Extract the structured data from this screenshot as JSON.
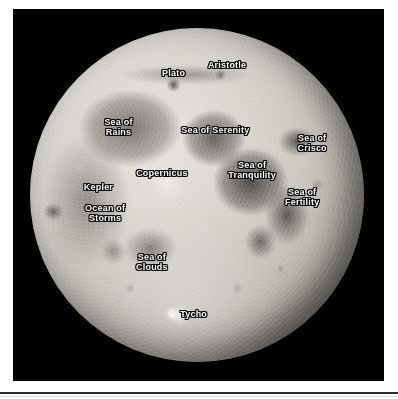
{
  "figure": {
    "background_color": "#ffffff",
    "plate_color": "#000000",
    "label_text_color": "#ffffff",
    "label_outline_color": "#000000"
  },
  "moon": {
    "disc_center_x_pct": 50,
    "disc_center_y_pct": 50,
    "labels": [
      {
        "name": "plato",
        "text": "Plato",
        "x_pct": 43.0,
        "y_pct": 13.5
      },
      {
        "name": "aristotle",
        "text": "Aristotle",
        "x_pct": 59.0,
        "y_pct": 11.0
      },
      {
        "name": "sea-of-rains",
        "text": "Sea of\nRains",
        "x_pct": 26.5,
        "y_pct": 29.5
      },
      {
        "name": "sea-of-serenity",
        "text": "Sea of Serenity",
        "x_pct": 55.5,
        "y_pct": 30.5
      },
      {
        "name": "sea-of-crisco",
        "text": "Sea of\nCrisco",
        "x_pct": 84.5,
        "y_pct": 34.5
      },
      {
        "name": "sea-of-tranquility",
        "text": "Sea of\nTranquility",
        "x_pct": 66.5,
        "y_pct": 42.5
      },
      {
        "name": "copernicus",
        "text": "Copernicus",
        "x_pct": 39.5,
        "y_pct": 43.5
      },
      {
        "name": "sea-of-fertility",
        "text": "Sea of\nFertility",
        "x_pct": 81.5,
        "y_pct": 50.5
      },
      {
        "name": "kepler",
        "text": "Kepler",
        "x_pct": 20.5,
        "y_pct": 47.5
      },
      {
        "name": "ocean-of-storms",
        "text": "Ocean of\nStorms",
        "x_pct": 22.5,
        "y_pct": 55.5
      },
      {
        "name": "sea-of-clouds",
        "text": "Sea of\nClouds",
        "x_pct": 36.5,
        "y_pct": 70.0
      },
      {
        "name": "tycho",
        "text": "Tycho",
        "x_pct": 49.0,
        "y_pct": 85.5
      }
    ],
    "tycho_marker": {
      "x_pct": 42.5,
      "y_pct": 85.5
    }
  }
}
